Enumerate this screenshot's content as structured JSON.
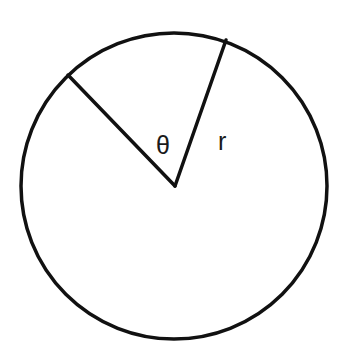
{
  "diagram": {
    "type": "circle-sector",
    "labels": {
      "angle": "θ",
      "radius": "r"
    },
    "colors": {
      "stroke": "#111111",
      "background": "#ffffff"
    }
  }
}
